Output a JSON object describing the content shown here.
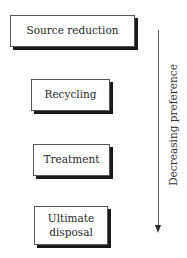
{
  "diagram": {
    "type": "waste-management-hierarchy",
    "boxes": [
      {
        "label": "Source reduction"
      },
      {
        "label": "Recycling"
      },
      {
        "label": "Treatment"
      },
      {
        "label": "Ultimate\ndisposal",
        "lines": [
          "Ultimate",
          "disposal"
        ]
      }
    ],
    "arrow": {
      "direction": "down",
      "label": "Decreasing preference"
    },
    "colors": {
      "box_border": "#555555",
      "box_shadow": "#1a1a1a",
      "text": "#2a2a2a",
      "background": "#ffffff"
    }
  }
}
